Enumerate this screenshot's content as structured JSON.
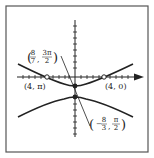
{
  "figure": {
    "type": "polar-conic-hyperbola",
    "frame": {
      "x": 6,
      "y": 6,
      "w": 142,
      "h": 146
    },
    "colors": {
      "stroke": "#222222",
      "frame": "#555555",
      "background": "#ffffff"
    },
    "axes": {
      "polar_axis_arrow": true,
      "tick_marks": true
    },
    "points": [
      {
        "id": "vertex-upper",
        "label": "(8/7, 3π/2)",
        "filled": true
      },
      {
        "id": "vertex-lower",
        "label": "(−8/3, π/2)",
        "filled": true
      },
      {
        "id": "point-left",
        "label": "(4, π)",
        "filled": false
      },
      {
        "id": "point-right",
        "label": "(4, 0)",
        "filled": false
      }
    ],
    "labels": {
      "upper_vertex": {
        "num_r": "8",
        "den_r": "7",
        "num_t": "3π",
        "den_t": "2"
      },
      "lower_vertex": {
        "sign": "−",
        "num_r": "8",
        "den_r": "3",
        "num_t": "π",
        "den_t": "2"
      },
      "left_point": "(4, π)",
      "right_point": "(4, 0)"
    }
  }
}
